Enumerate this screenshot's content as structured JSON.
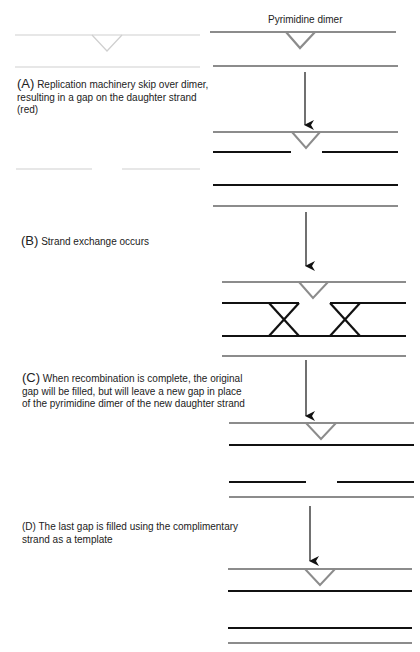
{
  "title": "Pyrimidine dimer",
  "colors": {
    "parental_strand": "#8c8c8c",
    "daughter_strand": "#111111",
    "ghost_strand": "#cfcfcf",
    "arrow": "#111111",
    "background": "#ffffff"
  },
  "steps": [
    {
      "id": "A",
      "marker": "(A)",
      "lines": [
        "Replication machinery skip over dimer,",
        "resulting in a gap on the daughter strand",
        "(red)"
      ]
    },
    {
      "id": "B",
      "marker": "(B)",
      "lines": [
        "Strand exchange occurs"
      ]
    },
    {
      "id": "C",
      "marker": "(C)",
      "lines": [
        "When recombination is complete, the original",
        "gap will be filled, but will leave a new gap in place",
        "of the pyrimidine dimer of the new daughter strand"
      ]
    },
    {
      "id": "D",
      "marker": "(D)",
      "lines": [
        "The last gap is filled using the complimentary",
        "strand as a template"
      ]
    }
  ]
}
